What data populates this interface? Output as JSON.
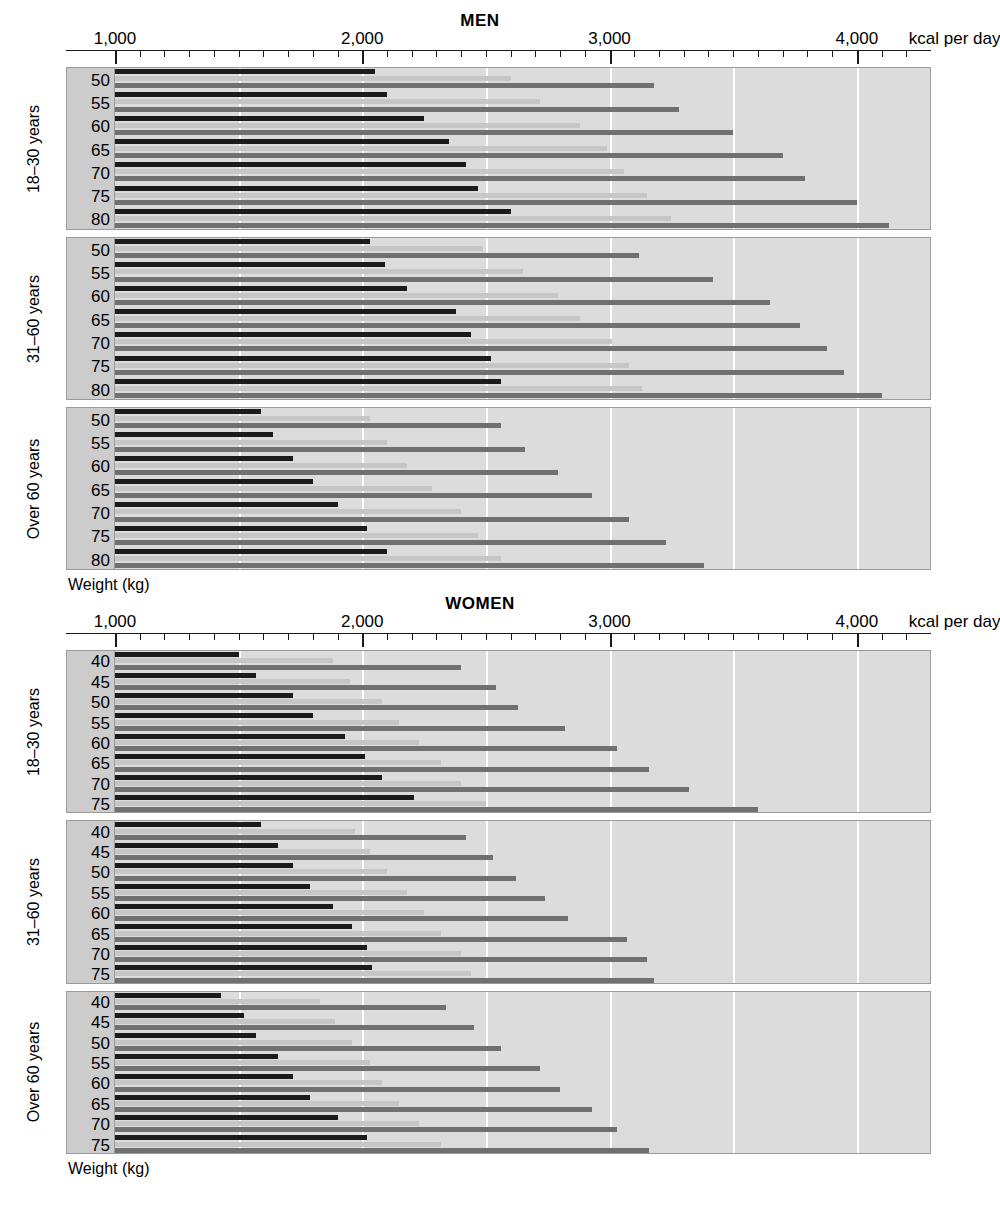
{
  "axis": {
    "ticks_major": [
      1000,
      2000,
      3000,
      4000
    ],
    "tick_labels": [
      "1,000",
      "2,000",
      "3,000",
      "4,000"
    ],
    "unit_label": "kcal per day",
    "minor_step": 100,
    "axis_min": 1000,
    "axis_max": 4300,
    "gridline_step": 500
  },
  "weight_axis_caption": "Weight (kg)",
  "series_names": [
    "low activity",
    "moderate activity",
    "high activity"
  ],
  "colors": {
    "dark": "#1b1b1b",
    "light": "#c6c6c6",
    "medium": "#707070",
    "panel": "#dcdcdc",
    "label_panel": "#cccccc",
    "gridline": "#ffffff",
    "border": "#9a9a9a"
  },
  "chart_data": {
    "type": "bar",
    "xlabel": "kcal per day",
    "ylabel": "Weight (kg)",
    "xlim": [
      1000,
      4300
    ],
    "grid": true,
    "legend": null,
    "orientation": "horizontal",
    "panels": [
      {
        "sex": "MEN",
        "title": "MEN",
        "groups": [
          {
            "age_label": "18–30 years",
            "categories": [
              50,
              55,
              60,
              65,
              70,
              75,
              80
            ],
            "series": [
              {
                "name": "low activity",
                "shade": "dark",
                "values": [
                  2050,
                  2100,
                  2250,
                  2350,
                  2420,
                  2470,
                  2600
                ]
              },
              {
                "name": "moderate activity",
                "shade": "light",
                "values": [
                  2600,
                  2720,
                  2880,
                  2990,
                  3060,
                  3150,
                  3250
                ]
              },
              {
                "name": "high activity",
                "shade": "medium",
                "values": [
                  3180,
                  3280,
                  3500,
                  3700,
                  3790,
                  4000,
                  4130
                ]
              }
            ]
          },
          {
            "age_label": "31–60 years",
            "categories": [
              50,
              55,
              60,
              65,
              70,
              75,
              80
            ],
            "series": [
              {
                "name": "low activity",
                "shade": "dark",
                "values": [
                  2030,
                  2090,
                  2180,
                  2380,
                  2440,
                  2520,
                  2560
                ]
              },
              {
                "name": "moderate activity",
                "shade": "light",
                "values": [
                  2490,
                  2650,
                  2790,
                  2880,
                  3010,
                  3080,
                  3130
                ]
              },
              {
                "name": "high activity",
                "shade": "medium",
                "values": [
                  3120,
                  3420,
                  3650,
                  3770,
                  3880,
                  3950,
                  4100
                ]
              }
            ]
          },
          {
            "age_label": "Over 60 years",
            "categories": [
              50,
              55,
              60,
              65,
              70,
              75,
              80
            ],
            "series": [
              {
                "name": "low activity",
                "shade": "dark",
                "values": [
                  1590,
                  1640,
                  1720,
                  1800,
                  1900,
                  2020,
                  2100
                ]
              },
              {
                "name": "moderate activity",
                "shade": "light",
                "values": [
                  2030,
                  2100,
                  2180,
                  2280,
                  2400,
                  2470,
                  2560
                ]
              },
              {
                "name": "high activity",
                "shade": "medium",
                "values": [
                  2560,
                  2660,
                  2790,
                  2930,
                  3080,
                  3230,
                  3380
                ]
              }
            ]
          }
        ]
      },
      {
        "sex": "WOMEN",
        "title": "WOMEN",
        "groups": [
          {
            "age_label": "18–30 years",
            "categories": [
              40,
              45,
              50,
              55,
              60,
              65,
              70,
              75
            ],
            "series": [
              {
                "name": "low activity",
                "shade": "dark",
                "values": [
                  1500,
                  1570,
                  1720,
                  1800,
                  1930,
                  2010,
                  2080,
                  2210
                ]
              },
              {
                "name": "moderate activity",
                "shade": "light",
                "values": [
                  1880,
                  1950,
                  2080,
                  2150,
                  2230,
                  2320,
                  2400,
                  2500
                ]
              },
              {
                "name": "high activity",
                "shade": "medium",
                "values": [
                  2400,
                  2540,
                  2630,
                  2820,
                  3030,
                  3160,
                  3320,
                  3600
                ]
              }
            ]
          },
          {
            "age_label": "31–60 years",
            "categories": [
              40,
              45,
              50,
              55,
              60,
              65,
              70,
              75
            ],
            "series": [
              {
                "name": "low activity",
                "shade": "dark",
                "values": [
                  1590,
                  1660,
                  1720,
                  1790,
                  1880,
                  1960,
                  2020,
                  2040
                ]
              },
              {
                "name": "moderate activity",
                "shade": "light",
                "values": [
                  1970,
                  2030,
                  2100,
                  2180,
                  2250,
                  2320,
                  2400,
                  2440
                ]
              },
              {
                "name": "high activity",
                "shade": "medium",
                "values": [
                  2420,
                  2530,
                  2620,
                  2740,
                  2830,
                  3070,
                  3150,
                  3180
                ]
              }
            ]
          },
          {
            "age_label": "Over 60 years",
            "categories": [
              40,
              45,
              50,
              55,
              60,
              65,
              70,
              75
            ],
            "series": [
              {
                "name": "low activity",
                "shade": "dark",
                "values": [
                  1430,
                  1520,
                  1570,
                  1660,
                  1720,
                  1790,
                  1900,
                  2020
                ]
              },
              {
                "name": "moderate activity",
                "shade": "light",
                "values": [
                  1830,
                  1890,
                  1960,
                  2030,
                  2080,
                  2150,
                  2230,
                  2320
                ]
              },
              {
                "name": "high activity",
                "shade": "medium",
                "values": [
                  2340,
                  2450,
                  2560,
                  2720,
                  2800,
                  2930,
                  3030,
                  3160
                ]
              }
            ]
          }
        ]
      }
    ]
  }
}
